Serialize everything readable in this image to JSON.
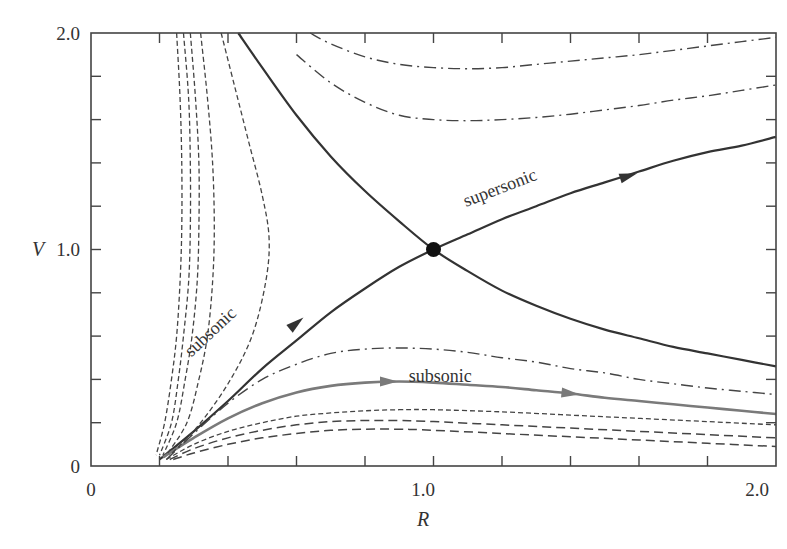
{
  "chart_data": {
    "type": "line",
    "title": "",
    "xlabel": "R",
    "ylabel": "V",
    "xlim": [
      0,
      2.0
    ],
    "ylim": [
      0,
      2.0
    ],
    "grid": false,
    "legend": null,
    "x_tick_labels": [
      "0",
      "1.0",
      "2.0"
    ],
    "y_tick_labels": [
      "0",
      "1.0",
      "2.0"
    ],
    "minor_tick_step": 0.2,
    "colors": {
      "frame": "#444444",
      "solid": "#333333",
      "gray": "#7a7a7a",
      "dashed": "#444444"
    },
    "critical_point": {
      "x": 1.0,
      "y": 1.0
    },
    "annotations": [
      {
        "text": "supersonic",
        "x": 1.2,
        "y": 1.26,
        "angle": -21
      },
      {
        "text": "subsonic",
        "x": 0.36,
        "y": 0.6,
        "angle": -43
      },
      {
        "text": "subsonic",
        "x": 1.02,
        "y": 0.39,
        "angle": 0
      }
    ],
    "series": [
      {
        "name": "transonic (accretion/wind) solution",
        "style": "solid",
        "color": "#333333",
        "width": 2.2,
        "points": [
          [
            0.2,
            0.03
          ],
          [
            0.3,
            0.16
          ],
          [
            0.4,
            0.3
          ],
          [
            0.5,
            0.45
          ],
          [
            0.6,
            0.58
          ],
          [
            0.7,
            0.71
          ],
          [
            0.8,
            0.82
          ],
          [
            0.9,
            0.92
          ],
          [
            1.0,
            1.0
          ],
          [
            1.1,
            1.07
          ],
          [
            1.2,
            1.14
          ],
          [
            1.3,
            1.2
          ],
          [
            1.4,
            1.26
          ],
          [
            1.5,
            1.31
          ],
          [
            1.6,
            1.36
          ],
          [
            1.7,
            1.41
          ],
          [
            1.8,
            1.45
          ],
          [
            1.9,
            1.48
          ],
          [
            2.0,
            1.52
          ]
        ],
        "arrows": [
          [
            0.6,
            0.66
          ],
          [
            1.57,
            1.34
          ]
        ]
      },
      {
        "name": "transonic (other branch)",
        "style": "solid",
        "color": "#333333",
        "width": 2.2,
        "points": [
          [
            0.43,
            2.0
          ],
          [
            0.5,
            1.84
          ],
          [
            0.6,
            1.62
          ],
          [
            0.7,
            1.43
          ],
          [
            0.8,
            1.27
          ],
          [
            0.9,
            1.13
          ],
          [
            1.0,
            1.0
          ],
          [
            1.1,
            0.9
          ],
          [
            1.2,
            0.81
          ],
          [
            1.3,
            0.74
          ],
          [
            1.4,
            0.68
          ],
          [
            1.5,
            0.63
          ],
          [
            1.6,
            0.59
          ],
          [
            1.7,
            0.55
          ],
          [
            1.8,
            0.52
          ],
          [
            1.9,
            0.49
          ],
          [
            2.0,
            0.46
          ]
        ]
      },
      {
        "name": "subsonic (gray)",
        "style": "solid",
        "color": "#7a7a7a",
        "width": 2.6,
        "points": [
          [
            0.21,
            0.04
          ],
          [
            0.3,
            0.13
          ],
          [
            0.4,
            0.22
          ],
          [
            0.5,
            0.29
          ],
          [
            0.6,
            0.34
          ],
          [
            0.7,
            0.37
          ],
          [
            0.8,
            0.385
          ],
          [
            0.9,
            0.39
          ],
          [
            1.0,
            0.385
          ],
          [
            1.1,
            0.375
          ],
          [
            1.2,
            0.365
          ],
          [
            1.3,
            0.35
          ],
          [
            1.4,
            0.335
          ],
          [
            1.5,
            0.315
          ],
          [
            1.6,
            0.3
          ],
          [
            1.7,
            0.285
          ],
          [
            1.8,
            0.27
          ],
          [
            1.9,
            0.255
          ],
          [
            2.0,
            0.24
          ]
        ],
        "arrows": [
          [
            0.87,
            0.39
          ],
          [
            1.4,
            0.335
          ]
        ]
      },
      {
        "name": "dash-dot upper 1",
        "style": "dashdot",
        "color": "#444444",
        "width": 1.4,
        "points": [
          [
            0.64,
            2.0
          ],
          [
            0.7,
            1.95
          ],
          [
            0.8,
            1.89
          ],
          [
            0.9,
            1.855
          ],
          [
            1.0,
            1.84
          ],
          [
            1.1,
            1.835
          ],
          [
            1.2,
            1.84
          ],
          [
            1.3,
            1.855
          ],
          [
            1.4,
            1.87
          ],
          [
            1.5,
            1.885
          ],
          [
            1.6,
            1.9
          ],
          [
            1.7,
            1.92
          ],
          [
            1.8,
            1.94
          ],
          [
            1.9,
            1.96
          ],
          [
            2.0,
            1.98
          ]
        ]
      },
      {
        "name": "dash-dot upper 2",
        "style": "dashdot",
        "color": "#444444",
        "width": 1.4,
        "points": [
          [
            0.6,
            1.9
          ],
          [
            0.7,
            1.77
          ],
          [
            0.8,
            1.68
          ],
          [
            0.9,
            1.62
          ],
          [
            1.0,
            1.6
          ],
          [
            1.1,
            1.595
          ],
          [
            1.2,
            1.6
          ],
          [
            1.3,
            1.61
          ],
          [
            1.4,
            1.625
          ],
          [
            1.5,
            1.645
          ],
          [
            1.6,
            1.665
          ],
          [
            1.7,
            1.69
          ],
          [
            1.8,
            1.71
          ],
          [
            1.9,
            1.735
          ],
          [
            2.0,
            1.76
          ]
        ]
      },
      {
        "name": "dash-dot lower",
        "style": "dashdot",
        "color": "#444444",
        "width": 1.4,
        "points": [
          [
            0.22,
            0.03
          ],
          [
            0.3,
            0.15
          ],
          [
            0.4,
            0.29
          ],
          [
            0.5,
            0.4
          ],
          [
            0.6,
            0.47
          ],
          [
            0.7,
            0.52
          ],
          [
            0.8,
            0.54
          ],
          [
            0.9,
            0.545
          ],
          [
            1.0,
            0.54
          ],
          [
            1.1,
            0.525
          ],
          [
            1.2,
            0.5
          ],
          [
            1.3,
            0.48
          ],
          [
            1.4,
            0.45
          ],
          [
            1.5,
            0.43
          ],
          [
            1.6,
            0.4
          ],
          [
            1.7,
            0.38
          ],
          [
            1.8,
            0.36
          ],
          [
            1.9,
            0.345
          ],
          [
            2.0,
            0.33
          ]
        ]
      },
      {
        "name": "dashed left 1",
        "style": "dashed",
        "color": "#444444",
        "width": 1.3,
        "points": [
          [
            0.25,
            2.0
          ],
          [
            0.26,
            1.7
          ],
          [
            0.265,
            1.4
          ],
          [
            0.265,
            1.1
          ],
          [
            0.26,
            0.85
          ],
          [
            0.25,
            0.6
          ],
          [
            0.235,
            0.4
          ],
          [
            0.215,
            0.2
          ],
          [
            0.19,
            0.05
          ]
        ]
      },
      {
        "name": "dashed left 2",
        "style": "dashed",
        "color": "#444444",
        "width": 1.3,
        "points": [
          [
            0.27,
            2.0
          ],
          [
            0.285,
            1.7
          ],
          [
            0.29,
            1.4
          ],
          [
            0.29,
            1.1
          ],
          [
            0.285,
            0.85
          ],
          [
            0.27,
            0.6
          ],
          [
            0.255,
            0.4
          ],
          [
            0.235,
            0.2
          ],
          [
            0.2,
            0.05
          ]
        ]
      },
      {
        "name": "dashed left 3",
        "style": "dashed",
        "color": "#444444",
        "width": 1.3,
        "points": [
          [
            0.29,
            2.0
          ],
          [
            0.305,
            1.7
          ],
          [
            0.315,
            1.4
          ],
          [
            0.315,
            1.1
          ],
          [
            0.31,
            0.85
          ],
          [
            0.295,
            0.6
          ],
          [
            0.275,
            0.4
          ],
          [
            0.25,
            0.2
          ],
          [
            0.21,
            0.05
          ]
        ]
      },
      {
        "name": "dashed left 4",
        "style": "dashed",
        "color": "#444444",
        "width": 1.3,
        "points": [
          [
            0.32,
            2.0
          ],
          [
            0.34,
            1.7
          ],
          [
            0.355,
            1.4
          ],
          [
            0.36,
            1.1
          ],
          [
            0.355,
            0.85
          ],
          [
            0.34,
            0.6
          ],
          [
            0.315,
            0.4
          ],
          [
            0.28,
            0.2
          ],
          [
            0.22,
            0.05
          ]
        ]
      },
      {
        "name": "dashed left 5",
        "style": "dashed",
        "color": "#444444",
        "width": 1.3,
        "points": [
          [
            0.38,
            2.0
          ],
          [
            0.42,
            1.75
          ],
          [
            0.46,
            1.5
          ],
          [
            0.5,
            1.25
          ],
          [
            0.52,
            1.05
          ],
          [
            0.51,
            0.85
          ],
          [
            0.47,
            0.6
          ],
          [
            0.4,
            0.38
          ],
          [
            0.31,
            0.18
          ],
          [
            0.23,
            0.05
          ]
        ]
      },
      {
        "name": "dashed lower 1",
        "style": "dashed",
        "color": "#444444",
        "width": 1.3,
        "points": [
          [
            0.22,
            0.03
          ],
          [
            0.3,
            0.1
          ],
          [
            0.4,
            0.16
          ],
          [
            0.5,
            0.2
          ],
          [
            0.6,
            0.23
          ],
          [
            0.7,
            0.245
          ],
          [
            0.8,
            0.255
          ],
          [
            0.9,
            0.26
          ],
          [
            1.0,
            0.26
          ],
          [
            1.2,
            0.25
          ],
          [
            1.4,
            0.235
          ],
          [
            1.6,
            0.22
          ],
          [
            1.8,
            0.205
          ],
          [
            2.0,
            0.19
          ]
        ]
      },
      {
        "name": "dashed lower 2",
        "style": "longdash",
        "color": "#444444",
        "width": 1.5,
        "points": [
          [
            0.23,
            0.03
          ],
          [
            0.3,
            0.08
          ],
          [
            0.4,
            0.13
          ],
          [
            0.5,
            0.165
          ],
          [
            0.6,
            0.19
          ],
          [
            0.7,
            0.205
          ],
          [
            0.8,
            0.21
          ],
          [
            0.9,
            0.21
          ],
          [
            1.0,
            0.205
          ],
          [
            1.2,
            0.19
          ],
          [
            1.4,
            0.175
          ],
          [
            1.6,
            0.16
          ],
          [
            1.8,
            0.145
          ],
          [
            2.0,
            0.13
          ]
        ]
      },
      {
        "name": "dashed lower 3",
        "style": "longdash",
        "color": "#444444",
        "width": 1.5,
        "points": [
          [
            0.24,
            0.03
          ],
          [
            0.3,
            0.06
          ],
          [
            0.4,
            0.1
          ],
          [
            0.5,
            0.13
          ],
          [
            0.6,
            0.15
          ],
          [
            0.7,
            0.165
          ],
          [
            0.8,
            0.17
          ],
          [
            0.9,
            0.17
          ],
          [
            1.0,
            0.165
          ],
          [
            1.2,
            0.15
          ],
          [
            1.4,
            0.135
          ],
          [
            1.6,
            0.12
          ],
          [
            1.8,
            0.105
          ],
          [
            2.0,
            0.09
          ]
        ]
      }
    ]
  }
}
